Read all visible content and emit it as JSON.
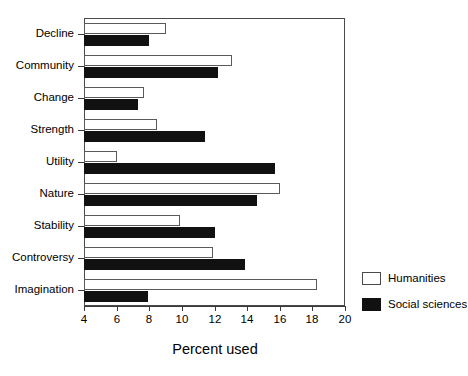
{
  "chart_data": {
    "type": "bar",
    "orientation": "horizontal",
    "title": "",
    "xlabel": "Percent used",
    "ylabel": "",
    "xlim": [
      4,
      20
    ],
    "xticks": [
      4,
      6,
      8,
      10,
      12,
      14,
      16,
      18,
      20
    ],
    "xtick_labels": [
      "4",
      "6",
      "8",
      "10",
      "12",
      "14",
      "16",
      "18",
      "20"
    ],
    "grid": false,
    "legend_position": "right",
    "categories": [
      "Decline",
      "Community",
      "Change",
      "Strength",
      "Utility",
      "Nature",
      "Stability",
      "Controversy",
      "Imagination"
    ],
    "series": [
      {
        "name": "Humanities",
        "color": "#ffffff",
        "edge_color": "#5a5a5a",
        "values": [
          9.0,
          13.1,
          7.7,
          8.5,
          6.0,
          16.0,
          9.9,
          11.9,
          18.3
        ]
      },
      {
        "name": "Social sciences",
        "color": "#111111",
        "edge_color": "#111111",
        "values": [
          8.0,
          12.2,
          7.3,
          11.4,
          15.7,
          14.6,
          12.0,
          13.9,
          7.9
        ]
      }
    ]
  },
  "axis": {
    "x_title": "Percent used"
  },
  "legend": {
    "entries": [
      {
        "label": "Humanities",
        "swatch": "open-square-swatch"
      },
      {
        "label": "Social sciences",
        "swatch": "filled-square-swatch"
      }
    ]
  }
}
